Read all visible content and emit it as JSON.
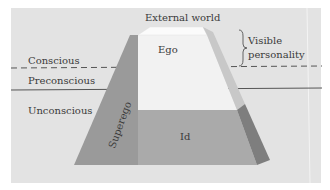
{
  "diagram": {
    "title": "External world",
    "levels": {
      "conscious": "Conscious",
      "preconscious": "Preconscious",
      "unconscious": "Unconscious"
    },
    "regions": {
      "ego": "Ego",
      "superego": "Superego",
      "id": "Id"
    },
    "annotation": {
      "line1": "Visible",
      "line2": "personality"
    },
    "colors": {
      "background_panel": "#e3e3e3",
      "ego_face": "#f2f2f2",
      "top_face": "#fafafa",
      "superego_band": "#9b9b9b",
      "id_face": "#aaaaaa",
      "right_side_light": "#c9c9c9",
      "right_side_dark": "#7e7e7e",
      "lines": "#555555"
    }
  }
}
